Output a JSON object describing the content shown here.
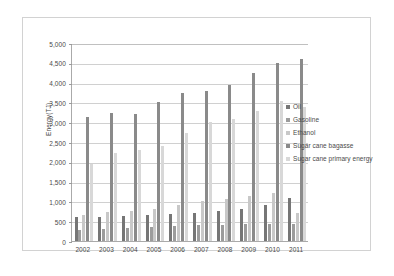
{
  "chart_data": {
    "type": "bar",
    "title": "",
    "xlabel": "",
    "ylabel": "Energy(TJ)",
    "ylim": [
      0,
      5000
    ],
    "ytick_step": 500,
    "grid": true,
    "legend_position": "right",
    "categories": [
      "2002",
      "2003",
      "2004",
      "2005",
      "2006",
      "2007",
      "2008",
      "2009",
      "2010",
      "2011"
    ],
    "ytick_labels": [
      "5,000",
      "4,500",
      "4,000",
      "3,500",
      "3,000",
      "2,500",
      "2,000",
      "1,500",
      "1,000",
      "500",
      "0"
    ],
    "series": [
      {
        "name": "Oil",
        "color": "#767676",
        "values": [
          615,
          615,
          640,
          660,
          685,
          720,
          760,
          815,
          900,
          1085
        ]
      },
      {
        "name": "Gasoline",
        "color": "#9c9c9c",
        "values": [
          290,
          300,
          320,
          345,
          375,
          395,
          405,
          420,
          430,
          440
        ]
      },
      {
        "name": "Ethanol",
        "color": "#c8c8c8",
        "values": [
          655,
          730,
          760,
          805,
          920,
          1005,
          1060,
          1125,
          1200,
          700
        ]
      },
      {
        "name": "Sugar cane bagasse",
        "color": "#8a8a8a",
        "values": [
          3130,
          3235,
          3210,
          3520,
          3730,
          3780,
          3930,
          4240,
          4490,
          4595
        ]
      },
      {
        "name": "Sugar cane primary energy",
        "color": "#d8d8d8",
        "values": [
          1955,
          2215,
          2290,
          2405,
          2730,
          3010,
          3090,
          3280,
          3545,
          3390
        ]
      }
    ]
  },
  "legend": {
    "entries": [
      {
        "label": "Oil"
      },
      {
        "label": "Gasoline"
      },
      {
        "label": "Ethanol"
      },
      {
        "label": "Sugar cane bagasse"
      },
      {
        "label": "Sugar cane primary energy"
      }
    ]
  },
  "caption": ""
}
